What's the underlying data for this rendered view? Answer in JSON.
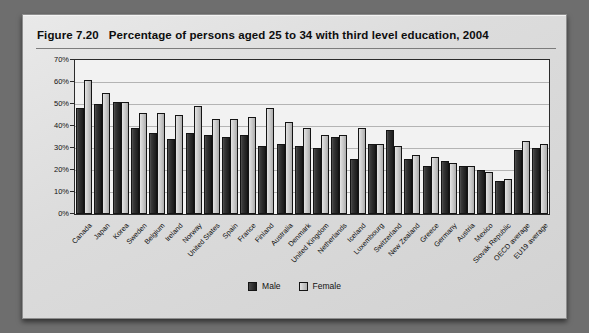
{
  "figure": {
    "number": "Figure 7.20",
    "title": "Percentage of persons aged 25 to 34 with third level education, 2004"
  },
  "legend": {
    "position": "bottom-center",
    "items": [
      {
        "label": "Male",
        "color": "#262626"
      },
      {
        "label": "Female",
        "color": "#c8c8c8"
      }
    ]
  },
  "chart_data": {
    "type": "bar",
    "title": "Percentage of persons aged 25 to 34 with third level education, 2004",
    "xlabel": "",
    "ylabel": "",
    "ylim": [
      0,
      70
    ],
    "ytick_labels": [
      "0%",
      "10%",
      "20%",
      "30%",
      "40%",
      "50%",
      "60%",
      "70%"
    ],
    "ytick_values": [
      0,
      10,
      20,
      30,
      40,
      50,
      60,
      70
    ],
    "grid": true,
    "categories": [
      "Canada",
      "Japan",
      "Korea",
      "Sweden",
      "Belgium",
      "Ireland",
      "Norway",
      "United States",
      "Spain",
      "France",
      "Finland",
      "Australia",
      "Denmark",
      "United Kingdom",
      "Netherlands",
      "Iceland",
      "Luxembourg",
      "Switzerland",
      "New Zealand",
      "Greece",
      "Germany",
      "Austria",
      "Mexico",
      "Slovak Republic",
      "OECD average",
      "EU19 average"
    ],
    "series": [
      {
        "name": "Male",
        "values": [
          48,
          50,
          51,
          39,
          37,
          34,
          37,
          36,
          35,
          36,
          31,
          32,
          31,
          30,
          35,
          25,
          32,
          38,
          25,
          22,
          24,
          22,
          20,
          15,
          29,
          30
        ]
      },
      {
        "name": "Female",
        "values": [
          61,
          55,
          51,
          46,
          46,
          45,
          49,
          43,
          43,
          44,
          48,
          42,
          39,
          36,
          36,
          39,
          32,
          31,
          27,
          26,
          23,
          22,
          19,
          16,
          33,
          32
        ]
      }
    ]
  }
}
